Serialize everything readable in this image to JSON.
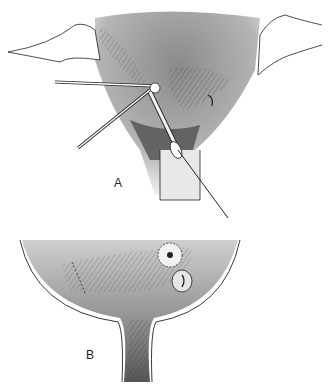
{
  "figure": {
    "panels": [
      {
        "label": "A",
        "description": "Surgical exposure with instruments (forceps and probe) inserted through opening; retracted tissue edges on both sides"
      },
      {
        "label": "B",
        "description": "Funnel-shaped cavity view showing sutured opening (ringed with stitches) adjacent to a second orifice; suture line on left wall"
      }
    ],
    "colors": {
      "background": "#ffffff",
      "shade_dark": "#555555",
      "shade_mid": "#9a9a9a",
      "shade_light": "#d6d6d6",
      "line": "#222222"
    }
  }
}
